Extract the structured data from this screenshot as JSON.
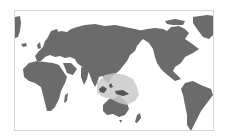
{
  "map": {
    "projection": "pacific-centered-world",
    "colors": {
      "background": "#ffffff",
      "border": "#d6d6d6",
      "land": "#6b6b6b",
      "highlight": "#c9c9c9"
    },
    "highlighted_region": "Maritime Southeast Asia / New Guinea / western Pacific"
  }
}
